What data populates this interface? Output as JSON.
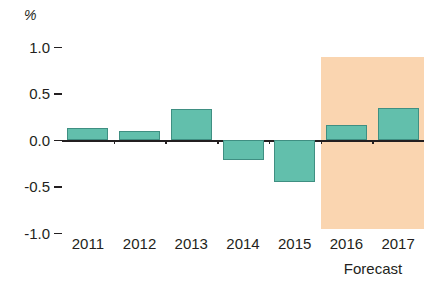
{
  "chart_data": {
    "type": "bar",
    "title": "",
    "subtitle": "",
    "xlabel": "",
    "ylabel": "%",
    "unit_label": "%",
    "categories": [
      "2011",
      "2012",
      "2013",
      "2014",
      "2015",
      "2016",
      "2017"
    ],
    "values": [
      0.13,
      0.1,
      0.33,
      -0.21,
      -0.45,
      0.16,
      0.34
    ],
    "series": [
      {
        "name": "",
        "values": [
          0.13,
          0.1,
          0.33,
          -0.21,
          -0.45,
          0.16,
          0.34
        ]
      }
    ],
    "ylim": [
      -1.0,
      1.0
    ],
    "ytick_labels": [
      "1.0",
      "0.5",
      "0.0",
      "-0.5",
      "-1.0"
    ],
    "ytick_values": [
      1.0,
      0.5,
      0.0,
      -0.5,
      -1.0
    ],
    "grid": false,
    "legend": null,
    "legend_position": "none",
    "annotations": [
      {
        "text": "Forecast",
        "covers_categories": [
          "2016",
          "2017"
        ],
        "kind": "shaded-region-caption"
      }
    ],
    "bar_color": "#62bfac",
    "bar_outline_color": "#3f8f82",
    "forecast_band_color": "#fad5b0",
    "axis_color": "#231f20"
  },
  "labels": {
    "unit": "%",
    "forecast": "Forecast"
  }
}
